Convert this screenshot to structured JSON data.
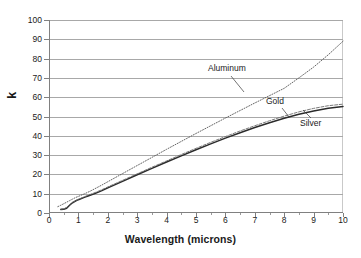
{
  "chart_data": {
    "type": "line",
    "title": "",
    "xlabel": "Wavelength (microns)",
    "ylabel": "k",
    "xlim": [
      0,
      10
    ],
    "ylim": [
      0,
      100
    ],
    "xticks": [
      0,
      1,
      2,
      3,
      4,
      5,
      6,
      7,
      8,
      9,
      10
    ],
    "yticks": [
      0,
      10,
      20,
      30,
      40,
      50,
      60,
      70,
      80,
      90,
      100
    ],
    "grid": "horizontal",
    "legend_position": "inline-annotations",
    "annotations": [
      {
        "text": "Aluminum",
        "x": 5.4,
        "y": 77
      },
      {
        "text": "Gold",
        "x": 7.4,
        "y": 60
      },
      {
        "text": "Silver",
        "x": 8.6,
        "y": 49
      }
    ],
    "series": [
      {
        "name": "Aluminum",
        "style": "dotted",
        "color": "#555555",
        "x": [
          0.3,
          0.4,
          0.5,
          0.6,
          0.7,
          0.8,
          0.9,
          1.0,
          1.2,
          1.4,
          1.6,
          1.8,
          2.0,
          2.5,
          3.0,
          3.5,
          4.0,
          4.5,
          5.0,
          5.5,
          6.0,
          6.5,
          7.0,
          7.5,
          8.0,
          8.5,
          9.0,
          9.5,
          10.0
        ],
        "y": [
          3.3,
          4.0,
          4.8,
          5.6,
          6.4,
          7.2,
          8.0,
          8.6,
          9.9,
          11.3,
          12.9,
          14.5,
          16.2,
          20.4,
          24.6,
          28.8,
          33.0,
          37.1,
          41.2,
          45.2,
          49.2,
          53.1,
          57.0,
          60.8,
          64.6,
          70.0,
          75.6,
          82.0,
          89.0
        ]
      },
      {
        "name": "Gold",
        "style": "solid",
        "color": "#2b2b2b",
        "x": [
          0.4,
          0.5,
          0.6,
          0.7,
          0.8,
          0.9,
          1.0,
          1.2,
          1.4,
          1.6,
          1.8,
          2.0,
          2.5,
          3.0,
          3.5,
          4.0,
          4.5,
          5.0,
          5.5,
          6.0,
          6.5,
          7.0,
          7.5,
          8.0,
          8.5,
          9.0,
          9.5,
          10.0
        ],
        "y": [
          1.8,
          1.9,
          2.5,
          4.0,
          5.3,
          6.2,
          6.9,
          8.1,
          9.2,
          10.3,
          11.6,
          13.0,
          16.4,
          19.8,
          23.1,
          26.4,
          29.6,
          32.8,
          35.8,
          38.8,
          41.6,
          44.3,
          46.8,
          49.1,
          51.2,
          52.9,
          54.3,
          55.2
        ]
      },
      {
        "name": "Silver",
        "style": "dashed",
        "color": "#6b6b6b",
        "x": [
          0.4,
          0.5,
          0.6,
          0.7,
          0.8,
          0.9,
          1.0,
          1.2,
          1.4,
          1.6,
          1.8,
          2.0,
          2.5,
          3.0,
          3.5,
          4.0,
          4.5,
          5.0,
          5.5,
          6.0,
          6.5,
          7.0,
          7.5,
          8.0,
          8.5,
          9.0,
          9.5,
          10.0
        ],
        "y": [
          2.0,
          2.2,
          2.9,
          4.3,
          5.5,
          6.4,
          7.1,
          8.4,
          9.6,
          10.8,
          12.1,
          13.5,
          16.9,
          20.3,
          23.7,
          27.0,
          30.3,
          33.5,
          36.6,
          39.6,
          42.5,
          45.2,
          47.8,
          50.2,
          52.4,
          54.2,
          55.6,
          56.4
        ]
      }
    ]
  },
  "axes": {
    "y_title": "k",
    "x_title": "Wavelength (microns)",
    "y_labels": [
      "100",
      "90",
      "80",
      "70",
      "60",
      "50",
      "40",
      "30",
      "20",
      "10",
      "0"
    ],
    "x_labels": [
      "0",
      "1",
      "2",
      "3",
      "4",
      "5",
      "6",
      "7",
      "8",
      "9",
      "10"
    ]
  },
  "annotations": {
    "aluminum": "Aluminum",
    "gold": "Gold",
    "silver": "Silver"
  },
  "colors": {
    "gridline": "#a8a8a8",
    "axis": "#808080",
    "aluminum": "#555555",
    "gold": "#2b2b2b",
    "silver": "#6b6b6b",
    "background": "#ffffff",
    "text": "#1a1a1a"
  }
}
